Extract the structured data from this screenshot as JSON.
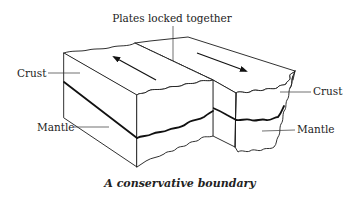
{
  "diagram": {
    "title_label": "Plates locked together",
    "caption": "A conservative boundary",
    "left_block": {
      "crust_label": "Crust",
      "mantle_label": "Mantle",
      "motion_arrow": "arrow-up-left"
    },
    "right_block": {
      "crust_label": "Crust",
      "mantle_label": "Mantle",
      "motion_arrow": "arrow-down-right"
    },
    "colors": {
      "line": "#1a1a1a",
      "background": "#ffffff"
    }
  }
}
